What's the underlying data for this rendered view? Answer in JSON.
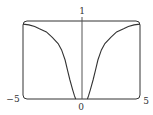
{
  "chart_data": {
    "type": "line",
    "title": "",
    "xlabel": "",
    "ylabel": "",
    "xlim": [
      -5,
      5
    ],
    "ylim": [
      0,
      1
    ],
    "grid": false,
    "legend": null,
    "tick_labels": {
      "x_left": "−5",
      "x_right": "5",
      "x_origin": "0",
      "y_top": "1"
    },
    "series": [
      {
        "name": "curve",
        "x": [
          -5,
          -4.5,
          -4,
          -3.6,
          -3,
          -2.5,
          -2,
          -1.7,
          -1.4,
          -1.2,
          -1,
          -0.76,
          -0.6,
          -0.5,
          0.5,
          0.6,
          0.76,
          1,
          1.2,
          1.4,
          1.7,
          2,
          2.5,
          3,
          3.6,
          4,
          4.5,
          5
        ],
        "y": [
          0.96,
          0.95,
          0.93,
          0.9,
          0.86,
          0.79,
          0.71,
          0.63,
          0.5,
          0.37,
          0.25,
          0.12,
          0.04,
          0,
          0,
          0.04,
          0.12,
          0.25,
          0.37,
          0.5,
          0.63,
          0.71,
          0.79,
          0.86,
          0.9,
          0.93,
          0.95,
          0.96
        ]
      }
    ],
    "colors": {
      "line": "#333333",
      "frame": "#333333"
    }
  }
}
